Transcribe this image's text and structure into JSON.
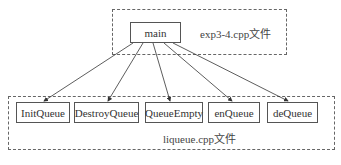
{
  "diagram": {
    "top_group": {
      "label": "exp3-4.cpp文件"
    },
    "bottom_group": {
      "label": "liqueue.cpp文件"
    },
    "root": {
      "label": "main"
    },
    "children": [
      {
        "label": "InitQueue"
      },
      {
        "label": "DestroyQueue"
      },
      {
        "label": "QueueEmpty"
      },
      {
        "label": "enQueue"
      },
      {
        "label": "deQueue"
      }
    ],
    "edges": [
      {
        "from": "main",
        "to": "InitQueue"
      },
      {
        "from": "main",
        "to": "DestroyQueue"
      },
      {
        "from": "main",
        "to": "QueueEmpty"
      },
      {
        "from": "main",
        "to": "enQueue"
      },
      {
        "from": "main",
        "to": "deQueue"
      }
    ]
  }
}
